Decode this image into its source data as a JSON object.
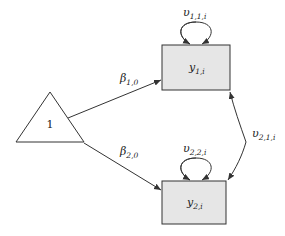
{
  "diagram": {
    "type": "path-diagram",
    "constant_node": {
      "label": "1"
    },
    "nodes": [
      {
        "id": "y1",
        "label_main": "y",
        "label_sub": "1,i"
      },
      {
        "id": "y2",
        "label_main": "y",
        "label_sub": "2,i"
      }
    ],
    "paths": [
      {
        "from": "1",
        "to": "y1",
        "label_main": "β",
        "label_sub": "1,0"
      },
      {
        "from": "1",
        "to": "y2",
        "label_main": "β",
        "label_sub": "2,0"
      }
    ],
    "variances": [
      {
        "node": "y1",
        "label_main": "υ",
        "label_sub": "1,1,i"
      },
      {
        "node": "y2",
        "label_main": "υ",
        "label_sub": "2,2,i"
      }
    ],
    "covariances": [
      {
        "between": [
          "y1",
          "y2"
        ],
        "label_main": "υ",
        "label_sub": "2,1,i"
      }
    ],
    "colors": {
      "box_fill": "#e6e6e6",
      "stroke": "#333333"
    }
  }
}
